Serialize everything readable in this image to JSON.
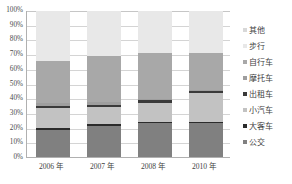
{
  "chart_data": {
    "type": "bar",
    "subtype": "stacked-100-percent",
    "title": "",
    "xlabel": "",
    "ylabel": "",
    "categories": [
      "2006 年",
      "2007 年",
      "2008 年",
      "2010 年"
    ],
    "ylim": [
      0,
      100
    ],
    "ytick_labels": [
      "100%",
      "90%",
      "80%",
      "70%",
      "60%",
      "50%",
      "40%",
      "30%",
      "20%",
      "10%",
      "0%"
    ],
    "ytick_values": [
      100,
      90,
      80,
      70,
      60,
      50,
      40,
      30,
      20,
      10,
      0
    ],
    "grid": true,
    "legend_position": "right",
    "stack_order_bottom_to_top": [
      "公交",
      "大客车",
      "小汽车",
      "出租车",
      "摩托车",
      "自行车",
      "步行",
      "其他"
    ],
    "series": [
      {
        "name": "公交",
        "color": "#808080",
        "values": [
          18.5,
          21.0,
          23.5,
          23.5
        ]
      },
      {
        "name": "大客车",
        "color": "#2b2b2b",
        "values": [
          1.5,
          1.5,
          0.7,
          0.6
        ]
      },
      {
        "name": "小汽车",
        "color": "#c2c2c2",
        "values": [
          13.5,
          11.5,
          13.0,
          19.5
        ]
      },
      {
        "name": "出租车",
        "color": "#3a3a3a",
        "values": [
          1.5,
          1.5,
          1.8,
          1.8
        ]
      },
      {
        "name": "摩托车",
        "color": "#9e9e9e",
        "values": [
          2.0,
          2.0,
          0.5,
          0.5
        ]
      },
      {
        "name": "自行车",
        "color": "#a8a8a8",
        "values": [
          28.5,
          31.5,
          31.5,
          25.1
        ]
      },
      {
        "name": "步行",
        "color": "#e8e8e8",
        "values": [
          34.5,
          31.0,
          29.0,
          29.0
        ]
      },
      {
        "name": "其他",
        "color": "#d8d8d8",
        "values": [
          0.0,
          0.0,
          0.0,
          0.0
        ]
      }
    ],
    "legend_entries": [
      {
        "label": "其他",
        "color": "#d8d8d8"
      },
      {
        "label": "步行",
        "color": "#e8e8e8"
      },
      {
        "label": "自行车",
        "color": "#a8a8a8"
      },
      {
        "label": "摩托车",
        "color": "#9e9e9e"
      },
      {
        "label": "出租车",
        "color": "#3a3a3a"
      },
      {
        "label": "小汽车",
        "color": "#c2c2c2"
      },
      {
        "label": "大客车",
        "color": "#2b2b2b"
      },
      {
        "label": "公交",
        "color": "#808080"
      }
    ],
    "colors": {
      "grid": "#d4d4d4",
      "axis": "#b0b0b0",
      "text": "#3f3f3f",
      "background": "#ffffff"
    }
  }
}
